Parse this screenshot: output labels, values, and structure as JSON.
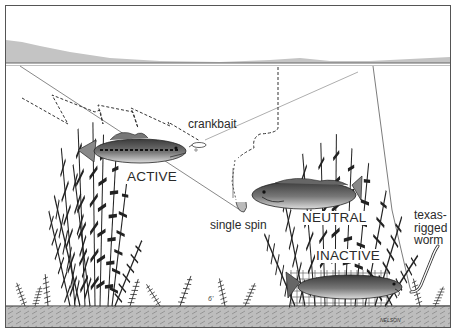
{
  "illustration": {
    "subject": "bass activity levels in weed cover with lure presentations",
    "colors": {
      "background": "#ffffff",
      "frame": "#555555",
      "distant_shore": "#c4c4c4",
      "lake_bottom": "#bdbdbd",
      "ink": "#2a2a2a"
    }
  },
  "labels": {
    "crankbait": "crankbait",
    "active": "ACTIVE",
    "single_spin": "single spin",
    "neutral": "NEUTRAL",
    "inactive": "INACTIVE",
    "texas_rigged_worm": [
      "texas-",
      "rigged",
      "worm"
    ],
    "depth_marker": "6'",
    "artist_signature": "NELSON"
  },
  "fish": [
    {
      "state": "ACTIVE",
      "lure": "crankbait"
    },
    {
      "state": "NEUTRAL",
      "lure": "single spin"
    },
    {
      "state": "INACTIVE",
      "lure": "texas-rigged worm"
    }
  ]
}
